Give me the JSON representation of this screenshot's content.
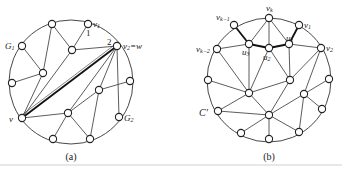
{
  "figures": [
    {
      "id": "a",
      "caption": "(a)",
      "circle": {
        "cx": 71,
        "cy": 82,
        "r": 62
      },
      "labels": {
        "v1": "v",
        "v1_sub": "1",
        "v2w": "v",
        "v2w_sub": "2",
        "v2w_rest": "=w",
        "G1": "G",
        "G1_sub": "1",
        "G2": "G",
        "G2_sub": "2",
        "v": "v",
        "num1": "1",
        "num2": "2"
      }
    },
    {
      "id": "b",
      "caption": "(b)",
      "circle": {
        "cx": 269,
        "cy": 80,
        "r": 62
      },
      "labels": {
        "vk": "v",
        "vk_sub": "k",
        "v1": "v",
        "v1_sub": "1",
        "vk1": "v",
        "vk1_sub": "k−1",
        "vk2": "v",
        "vk2_sub": "k−2",
        "v2": "v",
        "v2_sub": "2",
        "u1": "u",
        "u1_sub": "1",
        "u2": "u",
        "u2_sub": "2",
        "u3": "u",
        "u3_sub": "3",
        "C": "C′"
      }
    }
  ]
}
